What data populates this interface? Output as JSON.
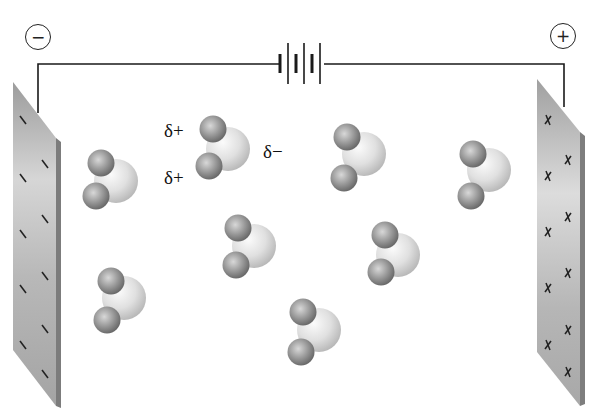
{
  "diagram": {
    "terminals": {
      "negative": {
        "symbol": "−"
      },
      "positive": {
        "symbol": "+"
      }
    },
    "battery": {
      "cells": 3
    },
    "electrodes": {
      "left": {
        "charge": "negative",
        "mark": "−",
        "mark_count": 11
      },
      "right": {
        "charge": "positive",
        "mark": "x",
        "mark_count": 11
      }
    },
    "partial_charges": {
      "delta_plus_top": "δ+",
      "delta_plus_bottom": "δ+",
      "delta_minus": "δ−"
    },
    "molecules": [
      {
        "id": "m1",
        "o": [
          116,
          181
        ],
        "h1": [
          101,
          163
        ],
        "h2": [
          96,
          196
        ]
      },
      {
        "id": "m2",
        "o": [
          228,
          149
        ],
        "h1": [
          213,
          129
        ],
        "h2": [
          209,
          166
        ]
      },
      {
        "id": "m3",
        "o": [
          124,
          298
        ],
        "h1": [
          111,
          281
        ],
        "h2": [
          107,
          320
        ]
      },
      {
        "id": "m4",
        "o": [
          254,
          246
        ],
        "h1": [
          238,
          228
        ],
        "h2": [
          236,
          265
        ]
      },
      {
        "id": "m5",
        "o": [
          364,
          154
        ],
        "h1": [
          347,
          137
        ],
        "h2": [
          344,
          178
        ]
      },
      {
        "id": "m6",
        "o": [
          489,
          170
        ],
        "h1": [
          473,
          154
        ],
        "h2": [
          471,
          196
        ]
      },
      {
        "id": "m7",
        "o": [
          398,
          255
        ],
        "h1": [
          385,
          235
        ],
        "h2": [
          381,
          272
        ]
      },
      {
        "id": "m8",
        "o": [
          319,
          330
        ],
        "h1": [
          303,
          312
        ],
        "h2": [
          301,
          352
        ]
      }
    ],
    "colors": {
      "background": "#ffffff",
      "wire": "#1a1a1a",
      "plate_light": "#d4d4d4",
      "plate_dark": "#8a8a8a",
      "oxygen": "#e2e2e2",
      "hydrogen": "#8e8e8e"
    }
  }
}
